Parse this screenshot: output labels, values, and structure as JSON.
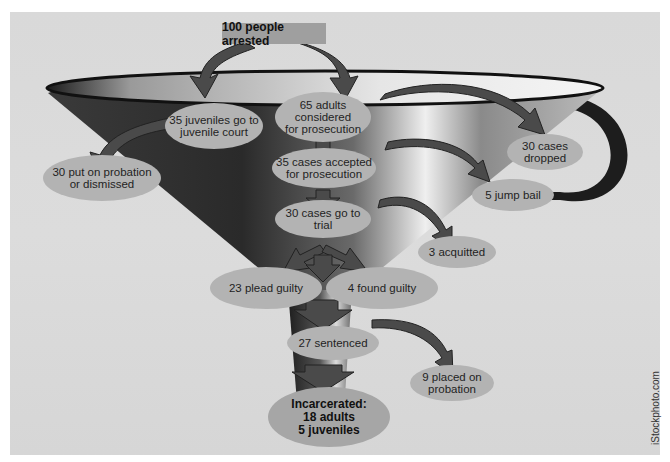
{
  "diagram": {
    "top": {
      "label": "100 people arrested"
    },
    "nodes": [
      {
        "id": "juveniles",
        "label": "35 juveniles go to\njuvenile court"
      },
      {
        "id": "adults",
        "label": "65 adults\nconsidered\nfor prosecution"
      },
      {
        "id": "probation_dismissed",
        "label": "30 put on probation\nor dismissed"
      },
      {
        "id": "dropped",
        "label": "30 cases\ndropped"
      },
      {
        "id": "accepted",
        "label": "35 cases accepted\nfor prosecution"
      },
      {
        "id": "jump_bail",
        "label": "5 jump bail"
      },
      {
        "id": "trial",
        "label": "30 cases go to\ntrial"
      },
      {
        "id": "acquitted",
        "label": "3 acquitted"
      },
      {
        "id": "plead_guilty",
        "label": "23 plead guilty"
      },
      {
        "id": "found_guilty",
        "label": "4 found guilty"
      },
      {
        "id": "sentenced",
        "label": "27 sentenced"
      },
      {
        "id": "placed_probation",
        "label": "9 placed on\nprobation"
      },
      {
        "id": "incarcerated",
        "label": "Incarcerated:\n18 adults\n5 juveniles"
      }
    ],
    "edges": [
      {
        "from": "top",
        "to": "juveniles"
      },
      {
        "from": "top",
        "to": "adults"
      },
      {
        "from": "juveniles",
        "to": "probation_dismissed"
      },
      {
        "from": "adults",
        "to": "dropped"
      },
      {
        "from": "adults",
        "to": "accepted"
      },
      {
        "from": "accepted",
        "to": "jump_bail"
      },
      {
        "from": "accepted",
        "to": "trial"
      },
      {
        "from": "trial",
        "to": "acquitted"
      },
      {
        "from": "trial",
        "to": "plead_guilty"
      },
      {
        "from": "trial",
        "to": "found_guilty"
      },
      {
        "from": "plead_guilty",
        "to": "sentenced"
      },
      {
        "from": "found_guilty",
        "to": "sentenced"
      },
      {
        "from": "sentenced",
        "to": "placed_probation"
      },
      {
        "from": "sentenced",
        "to": "incarcerated"
      }
    ],
    "colors": {
      "panel": "#d9d9d9",
      "ellipse": "#b3b3b3",
      "top_box": "#9f9f9f",
      "arrow": "#4a4a4a",
      "funnel_dark": "#2b2b2b",
      "text": "#1f1f1f"
    }
  },
  "credit": "iStockphoto.com"
}
